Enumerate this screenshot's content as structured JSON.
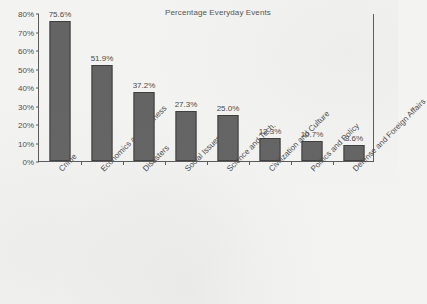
{
  "chart_data": {
    "type": "bar",
    "title": "Percentage Everyday Events",
    "xlabel": "",
    "ylabel": "",
    "ylim": [
      0,
      80
    ],
    "ytick_labels": [
      "0%",
      "10%",
      "20%",
      "30%",
      "40%",
      "50%",
      "60%",
      "70%",
      "80%"
    ],
    "ytick_values": [
      0,
      10,
      20,
      30,
      40,
      50,
      60,
      70,
      80
    ],
    "grid": false,
    "legend": null,
    "value_label_suffix": "%",
    "categories": [
      "Crime",
      "Economics and Business",
      "Disasters",
      "Social Issues",
      "Science and Tech.",
      "Civilization and Culture",
      "Politics and Policy",
      "Defense and Foreign Affairs"
    ],
    "values": [
      75.6,
      51.9,
      37.2,
      27.3,
      25.0,
      12.3,
      10.7,
      8.6
    ],
    "value_labels": [
      "75.6%",
      "51.9%",
      "37.2%",
      "27.3%",
      "25.0%",
      "12.3%",
      "10.7%",
      "8.6%"
    ],
    "colors": {
      "bar_fill": "#646464",
      "bar_edge": "#3f3f3f",
      "axis": "#5a5a5a",
      "text": "#4a4a4a",
      "background": "#f3f3f1"
    }
  }
}
